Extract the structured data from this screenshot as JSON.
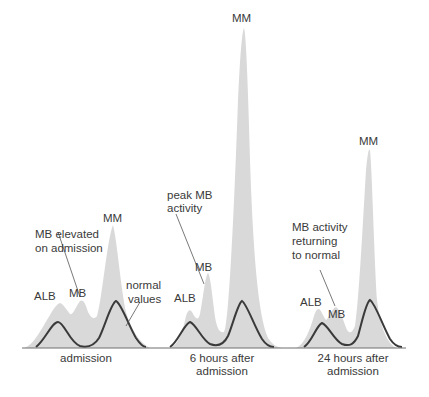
{
  "colors": {
    "background": "#ffffff",
    "activity_fill": "#d9d9d9",
    "normal_curve": "#3a3a3a",
    "baseline": "#6e6e6e",
    "text": "#3a3a3a"
  },
  "legend": {
    "normal_values_line1": "normal",
    "normal_values_line2": "values"
  },
  "panels": [
    {
      "caption_line1": "admission",
      "caption_line2": "",
      "peaks": {
        "alb": "ALB",
        "mb": "MB",
        "mm": "MM"
      },
      "annotation": {
        "line1": "MB elevated",
        "line2": "on admission",
        "line3": ""
      }
    },
    {
      "caption_line1": "6 hours after",
      "caption_line2": "admission",
      "peaks": {
        "alb": "ALB",
        "mb": "MB",
        "mm": "MM"
      },
      "annotation": {
        "line1": "peak MB",
        "line2": "activity",
        "line3": ""
      }
    },
    {
      "caption_line1": "24 hours after",
      "caption_line2": "admission",
      "peaks": {
        "alb": "ALB",
        "mb": "MB",
        "mm": "MM"
      },
      "annotation": {
        "line1": "MB activity",
        "line2": "returning",
        "line3": "to normal"
      }
    }
  ]
}
